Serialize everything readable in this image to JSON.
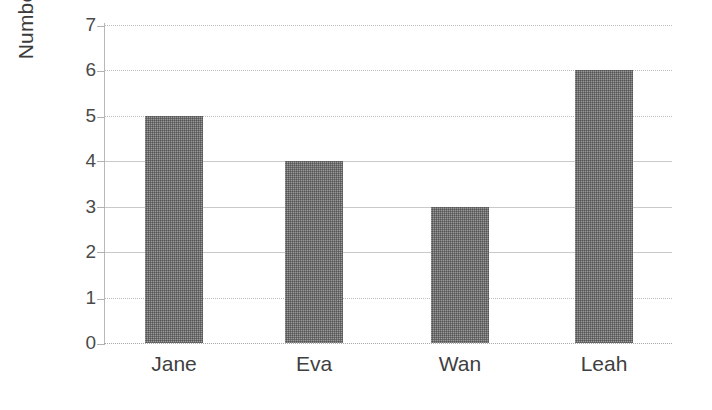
{
  "chart_data": {
    "type": "bar",
    "title": "",
    "subtitle": "",
    "xlabel": "",
    "ylabel": "Number of Pets",
    "categories": [
      "Jane",
      "Eva",
      "Wan",
      "Leah"
    ],
    "values": [
      5,
      4,
      3,
      6
    ],
    "series": [
      {
        "name": "Number of Pets",
        "values": [
          5,
          4,
          3,
          6
        ]
      }
    ],
    "ylim": [
      0,
      7
    ],
    "ytick_labels": [
      "0",
      "1",
      "2",
      "3",
      "4",
      "5",
      "6",
      "7"
    ],
    "ytick_values": [
      0,
      1,
      2,
      3,
      4,
      5,
      6,
      7
    ],
    "xtick_labels": [
      "Jane",
      "Eva",
      "Wan",
      "Leah"
    ],
    "grid": true,
    "grid_axis": "y",
    "legend": false,
    "legend_position": "none",
    "data_labels": false,
    "bar_color": "#6f6f6f",
    "bar_fill_style": "dithered-gray",
    "gridline_color": "#c9c9c9",
    "axis_color": "#b9b9b9",
    "text_color": "#3f3f3f",
    "background_color": "#ffffff"
  }
}
